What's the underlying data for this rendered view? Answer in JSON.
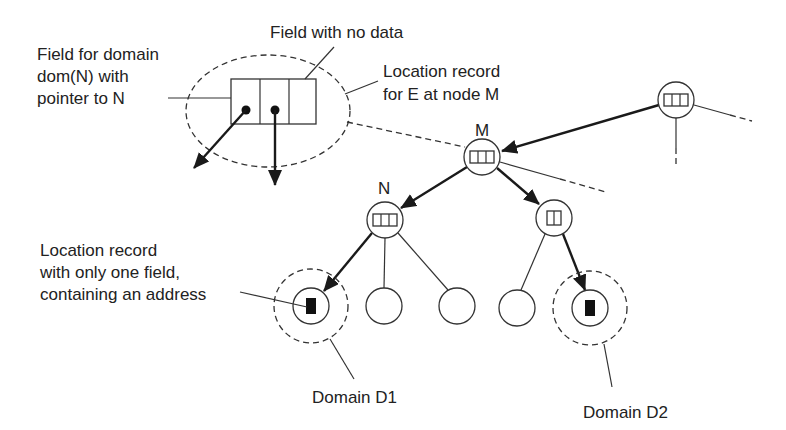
{
  "diagram": {
    "labels": {
      "field_for_domain": [
        "Field for domain",
        "dom(N) with",
        "pointer to N"
      ],
      "field_no_data": "Field with no data",
      "location_record_M": [
        "Location record",
        "for E at node M"
      ],
      "location_record_one_field": [
        "Location record",
        "with only one field,",
        "containing an address"
      ],
      "domain_d1": "Domain D1",
      "domain_d2": "Domain D2"
    },
    "nodes": {
      "root": {
        "label": "",
        "fields": 3
      },
      "M": {
        "label": "M",
        "fields": 3
      },
      "N": {
        "label": "N",
        "fields": 3
      },
      "R": {
        "label": "",
        "fields": 2
      },
      "leaf1": {
        "label": "",
        "fields": 1,
        "filled": true
      },
      "leaf2": {
        "label": "",
        "fields": 0
      },
      "leaf3": {
        "label": "",
        "fields": 0
      },
      "leaf4": {
        "label": "",
        "fields": 0
      },
      "leaf5": {
        "label": "",
        "fields": 1,
        "filled": true
      }
    },
    "colors": {
      "stroke": "#333333",
      "background": "#ffffff"
    }
  }
}
